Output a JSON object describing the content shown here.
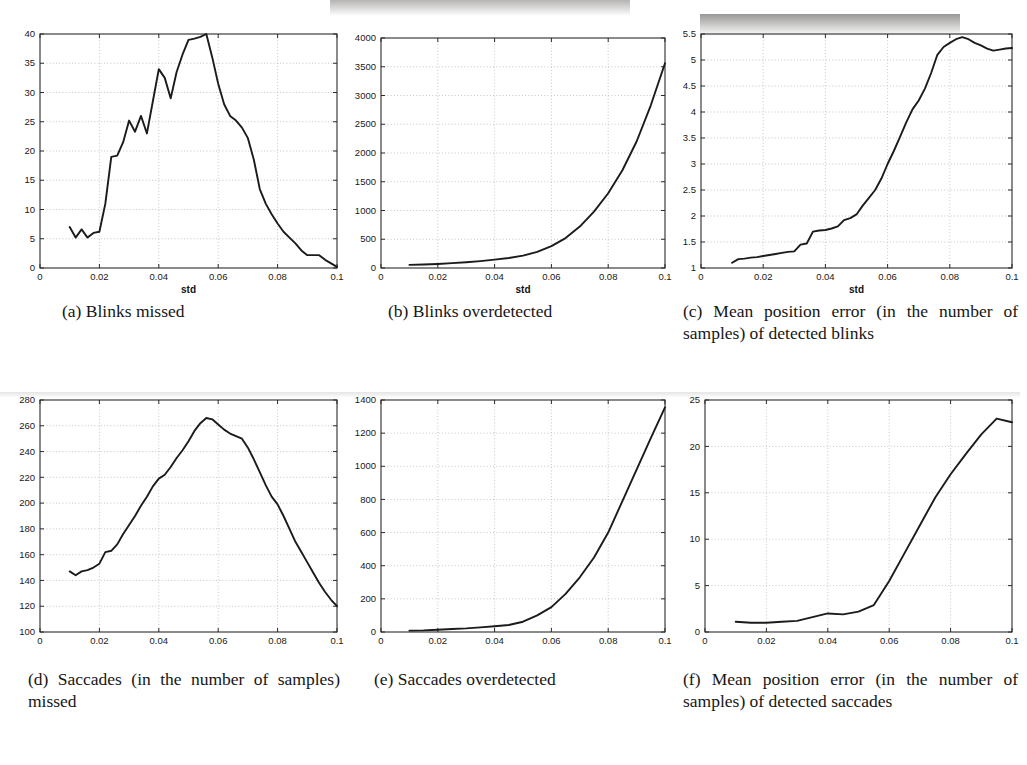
{
  "figure": {
    "panels": [
      {
        "id": "a",
        "caption": "(a) Blinks missed"
      },
      {
        "id": "b",
        "caption": "(b) Blinks overdetected"
      },
      {
        "id": "c",
        "caption": "(c) Mean position error (in the number of samples) of detected blinks"
      },
      {
        "id": "d",
        "caption": "(d) Saccades (in the number of samples) missed"
      },
      {
        "id": "e",
        "caption": "(e) Saccades overdetected"
      },
      {
        "id": "f",
        "caption": "(f) Mean position error (in the number of samples) of detected saccades"
      }
    ]
  },
  "chart_data": [
    {
      "type": "line",
      "panel": "a",
      "title": "Blinks missed",
      "xlabel": "std",
      "ylabel": "",
      "xlim": [
        0,
        0.1
      ],
      "ylim": [
        0,
        40
      ],
      "xticks": [
        0,
        0.02,
        0.04,
        0.06,
        0.08,
        0.1
      ],
      "xticklabels": [
        "0",
        "0.02",
        "0.04",
        "0.06",
        "0.08",
        "0.1"
      ],
      "yticks": [
        0,
        5,
        10,
        15,
        20,
        25,
        30,
        35,
        40
      ],
      "yticklabels": [
        "0",
        "5",
        "10",
        "15",
        "20",
        "25",
        "30",
        "35",
        "40"
      ],
      "grid": true,
      "legend": null,
      "x": [
        0.01,
        0.012,
        0.014,
        0.016,
        0.018,
        0.02,
        0.022,
        0.024,
        0.026,
        0.028,
        0.03,
        0.032,
        0.034,
        0.036,
        0.038,
        0.04,
        0.042,
        0.044,
        0.046,
        0.048,
        0.05,
        0.052,
        0.054,
        0.056,
        0.058,
        0.06,
        0.062,
        0.064,
        0.066,
        0.068,
        0.07,
        0.072,
        0.074,
        0.076,
        0.078,
        0.08,
        0.082,
        0.084,
        0.086,
        0.088,
        0.09,
        0.092,
        0.094,
        0.096,
        0.098,
        0.1
      ],
      "y": [
        7.0,
        5.2,
        6.6,
        5.2,
        6.0,
        6.2,
        11.0,
        19.0,
        19.2,
        21.5,
        25.2,
        23.3,
        26.0,
        23.0,
        28.5,
        34.0,
        32.5,
        29.0,
        33.5,
        36.5,
        39.0,
        39.2,
        39.5,
        40.0,
        36.0,
        31.5,
        28.0,
        26.0,
        25.2,
        24.0,
        22.2,
        18.5,
        13.5,
        11.0,
        9.2,
        7.6,
        6.2,
        5.2,
        4.2,
        3.0,
        2.2,
        2.2,
        2.2,
        1.4,
        0.8,
        0.2
      ]
    },
    {
      "type": "line",
      "panel": "b",
      "title": "Blinks overdetected",
      "xlabel": "std",
      "ylabel": "",
      "xlim": [
        0,
        0.1
      ],
      "ylim": [
        0,
        4000
      ],
      "xticks": [
        0,
        0.02,
        0.04,
        0.06,
        0.08,
        0.1
      ],
      "xticklabels": [
        "0",
        "0.02",
        "0.04",
        "0.06",
        "0.08",
        "0.1"
      ],
      "yticks": [
        0,
        500,
        1000,
        1500,
        2000,
        2500,
        3000,
        3500,
        4000
      ],
      "yticklabels": [
        "0",
        "500",
        "1000",
        "1500",
        "2000",
        "2500",
        "3000",
        "3500",
        "4000"
      ],
      "grid": true,
      "legend": null,
      "x": [
        0.01,
        0.015,
        0.02,
        0.025,
        0.03,
        0.035,
        0.04,
        0.045,
        0.05,
        0.055,
        0.06,
        0.065,
        0.07,
        0.075,
        0.08,
        0.085,
        0.09,
        0.095,
        0.1
      ],
      "y": [
        55,
        60,
        70,
        85,
        100,
        120,
        145,
        175,
        215,
        280,
        380,
        520,
        720,
        980,
        1300,
        1700,
        2200,
        2830,
        3560
      ]
    },
    {
      "type": "line",
      "panel": "c",
      "title": "Mean position error (in the number of samples) of detected blinks",
      "xlabel": "std",
      "ylabel": "",
      "xlim": [
        0,
        0.1
      ],
      "ylim": [
        1,
        5.5
      ],
      "xticks": [
        0,
        0.02,
        0.04,
        0.06,
        0.08,
        0.1
      ],
      "xticklabels": [
        "0",
        "0.02",
        "0.04",
        "0.06",
        "0.08",
        "0.1"
      ],
      "yticks": [
        1,
        1.5,
        2,
        2.5,
        3,
        3.5,
        4,
        4.5,
        5,
        5.5
      ],
      "yticklabels": [
        "1",
        "1.5",
        "2",
        "2.5",
        "3",
        "3.5",
        "4",
        "4.5",
        "5",
        "5.5"
      ],
      "grid": true,
      "legend": null,
      "x": [
        0.01,
        0.012,
        0.014,
        0.016,
        0.018,
        0.02,
        0.022,
        0.024,
        0.026,
        0.028,
        0.03,
        0.032,
        0.034,
        0.036,
        0.038,
        0.04,
        0.042,
        0.044,
        0.046,
        0.048,
        0.05,
        0.052,
        0.054,
        0.056,
        0.058,
        0.06,
        0.062,
        0.064,
        0.066,
        0.068,
        0.07,
        0.072,
        0.074,
        0.076,
        0.078,
        0.08,
        0.082,
        0.084,
        0.086,
        0.088,
        0.09,
        0.092,
        0.094,
        0.096,
        0.098,
        0.1
      ],
      "y": [
        1.1,
        1.17,
        1.18,
        1.2,
        1.21,
        1.23,
        1.25,
        1.27,
        1.29,
        1.31,
        1.32,
        1.45,
        1.47,
        1.7,
        1.72,
        1.73,
        1.76,
        1.8,
        1.92,
        1.96,
        2.03,
        2.2,
        2.35,
        2.5,
        2.72,
        3.0,
        3.25,
        3.52,
        3.8,
        4.05,
        4.22,
        4.45,
        4.75,
        5.1,
        5.25,
        5.33,
        5.4,
        5.44,
        5.4,
        5.33,
        5.28,
        5.22,
        5.18,
        5.2,
        5.22,
        5.23
      ]
    },
    {
      "type": "line",
      "panel": "d",
      "title": "Saccades (in the number of samples) missed",
      "xlabel": "std",
      "ylabel": "",
      "xlim": [
        0,
        0.1
      ],
      "ylim": [
        100,
        280
      ],
      "xticks": [
        0,
        0.02,
        0.04,
        0.06,
        0.08,
        0.1
      ],
      "xticklabels": [
        "0",
        "0.02",
        "0.04",
        "0.06",
        "0.08",
        "0.1"
      ],
      "yticks": [
        100,
        120,
        140,
        160,
        180,
        200,
        220,
        240,
        260,
        280
      ],
      "yticklabels": [
        "100",
        "120",
        "140",
        "160",
        "180",
        "200",
        "220",
        "240",
        "260",
        "280"
      ],
      "grid": true,
      "legend": null,
      "x": [
        0.01,
        0.012,
        0.014,
        0.016,
        0.018,
        0.02,
        0.022,
        0.024,
        0.026,
        0.028,
        0.03,
        0.032,
        0.034,
        0.036,
        0.038,
        0.04,
        0.042,
        0.044,
        0.046,
        0.048,
        0.05,
        0.052,
        0.054,
        0.056,
        0.058,
        0.06,
        0.062,
        0.064,
        0.066,
        0.068,
        0.07,
        0.072,
        0.074,
        0.076,
        0.078,
        0.08,
        0.082,
        0.084,
        0.086,
        0.088,
        0.09,
        0.092,
        0.094,
        0.096,
        0.098,
        0.1
      ],
      "y": [
        147,
        144,
        147,
        148,
        150,
        153,
        162,
        163,
        168,
        176,
        183,
        190,
        198,
        205,
        213,
        219,
        222,
        228,
        235,
        241,
        248,
        256,
        262,
        266,
        265,
        261,
        257,
        254,
        252,
        250,
        243,
        234,
        224,
        214,
        205,
        199,
        190,
        180,
        170,
        162,
        154,
        146,
        138,
        131,
        125,
        120
      ]
    },
    {
      "type": "line",
      "panel": "e",
      "title": "Saccades overdetected",
      "xlabel": "std",
      "ylabel": "",
      "xlim": [
        0,
        0.1
      ],
      "ylim": [
        0,
        1400
      ],
      "xticks": [
        0,
        0.02,
        0.04,
        0.06,
        0.08,
        0.1
      ],
      "xticklabels": [
        "0",
        "0.02",
        "0.04",
        "0.06",
        "0.08",
        "0.1"
      ],
      "yticks": [
        0,
        200,
        400,
        600,
        800,
        1000,
        1200,
        1400
      ],
      "yticklabels": [
        "0",
        "200",
        "400",
        "600",
        "800",
        "1000",
        "1200",
        "1400"
      ],
      "grid": true,
      "legend": null,
      "x": [
        0.01,
        0.015,
        0.02,
        0.025,
        0.03,
        0.035,
        0.04,
        0.045,
        0.05,
        0.055,
        0.06,
        0.065,
        0.07,
        0.075,
        0.08,
        0.085,
        0.09,
        0.095,
        0.1
      ],
      "y": [
        8,
        10,
        14,
        18,
        22,
        28,
        35,
        42,
        62,
        100,
        150,
        230,
        330,
        450,
        600,
        790,
        980,
        1170,
        1355
      ]
    },
    {
      "type": "line",
      "panel": "f",
      "title": "Mean position error (in the number of samples) of detected saccades",
      "xlabel": "std",
      "ylabel": "",
      "xlim": [
        0,
        0.1
      ],
      "ylim": [
        0,
        25
      ],
      "xticks": [
        0,
        0.02,
        0.04,
        0.06,
        0.08,
        0.1
      ],
      "xticklabels": [
        "0",
        "0.02",
        "0.04",
        "0.06",
        "0.08",
        "0.1"
      ],
      "yticks": [
        0,
        5,
        10,
        15,
        20,
        25
      ],
      "yticklabels": [
        "0",
        "5",
        "10",
        "15",
        "20",
        "25"
      ],
      "grid": true,
      "legend": null,
      "x": [
        0.01,
        0.015,
        0.02,
        0.025,
        0.03,
        0.035,
        0.04,
        0.045,
        0.05,
        0.055,
        0.06,
        0.065,
        0.07,
        0.075,
        0.08,
        0.085,
        0.09,
        0.095,
        0.1
      ],
      "y": [
        1.1,
        1.0,
        1.0,
        1.1,
        1.2,
        1.6,
        2.0,
        1.9,
        2.2,
        2.9,
        5.5,
        8.5,
        11.5,
        14.5,
        17.0,
        19.2,
        21.3,
        23.0,
        22.6
      ]
    }
  ]
}
